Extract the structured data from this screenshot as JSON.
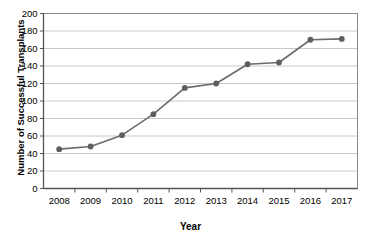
{
  "chart_data": {
    "type": "line",
    "title": "",
    "xlabel": "Year",
    "ylabel": "Number of Successful Transplants",
    "categories": [
      "2008",
      "2009",
      "2010",
      "2011",
      "2012",
      "2013",
      "2014",
      "2015",
      "2016",
      "2017"
    ],
    "values": [
      45,
      48,
      61,
      85,
      115,
      120,
      142,
      144,
      170,
      171
    ],
    "series": [
      {
        "name": "Successful Transplants",
        "values": [
          45,
          48,
          61,
          85,
          115,
          120,
          142,
          144,
          170,
          171
        ]
      }
    ],
    "ylim": [
      0,
      200
    ],
    "y_ticks": [
      0,
      20,
      40,
      60,
      80,
      100,
      120,
      140,
      160,
      180,
      200
    ],
    "y_tick_labels": [
      "0",
      "20",
      "40",
      "60",
      "80",
      "100",
      "120",
      "140",
      "160",
      "180",
      "200"
    ],
    "x_tick_labels": [
      "2008",
      "2009",
      "2010",
      "2011",
      "2012",
      "2013",
      "2014",
      "2015",
      "2016",
      "2017"
    ],
    "grid": "horizontal",
    "legend": "none",
    "marker": "circle",
    "colors": {
      "line": "#6b6b6b",
      "marker": "#5e5e5e",
      "gridline": "#c8c8c8",
      "axis": "#555555",
      "text": "#000000",
      "background": "#ffffff"
    }
  }
}
